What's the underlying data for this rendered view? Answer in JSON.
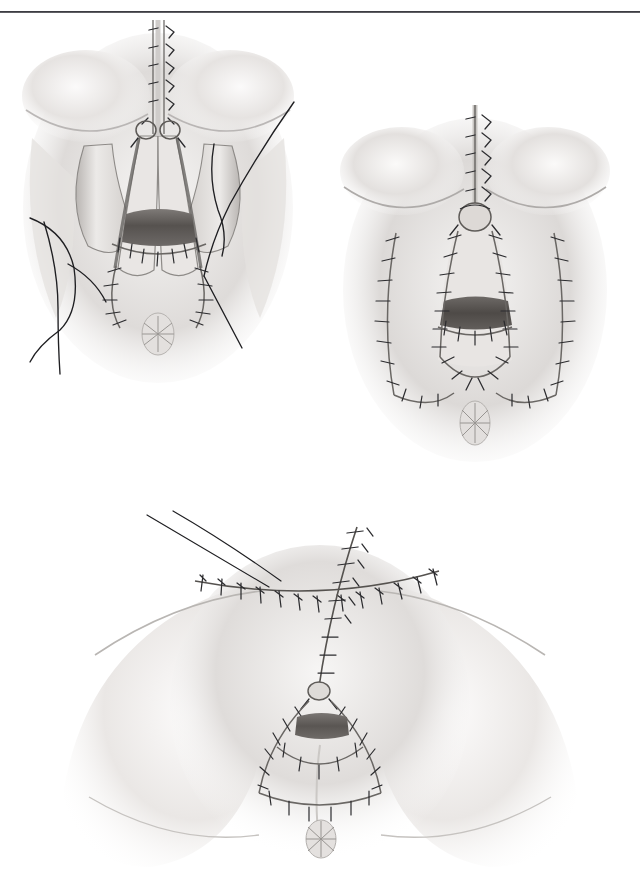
{
  "document": {
    "type": "surgical atlas page",
    "subject": "perineal wound closure and flap reconstruction",
    "background_color": "#ffffff",
    "rendering_style": "graphite pencil medical illustration"
  },
  "header": {
    "rule_color": "#2e2e33",
    "clipped_text": ".."
  },
  "figures": [
    {
      "id": "figure-1",
      "data_name": "figure-upper-left",
      "caption": "",
      "description": "Perineum with midline vertical suture line, everted flap edges held by long free suture strands on both sides, dark central opening, anus below",
      "elements": {
        "midline_suture_label": "midline vertical closure",
        "flap_label": "mobilized skin flap",
        "free_suture_label": "untied traction suture",
        "opening_label": "introital opening",
        "anus_label": "anus"
      },
      "colors": {
        "skin_light": "#f2f0ee",
        "skin_mid": "#c9c6c4",
        "skin_shadow": "#9a9795",
        "suture": "#2b2b2e",
        "opening_dark": "#56524f"
      }
    },
    {
      "id": "figure-2",
      "data_name": "figure-upper-right",
      "caption": "",
      "description": "Completed closure showing midline vertical suture line, central knot, paired V-shaped inner suture lines and two outer lateral donor-site suture lines",
      "elements": {
        "midline_suture_label": "midline vertical closure",
        "inner_v_label": "inner V-shaped suture line",
        "outer_lateral_label": "lateral donor-site closure",
        "opening_label": "introital opening",
        "anus_label": "anus"
      },
      "colors": {
        "skin_light": "#efedeb",
        "skin_mid": "#c4c1bf",
        "skin_shadow": "#94918f",
        "suture": "#2b2b2e",
        "opening_dark": "#4e4a47"
      }
    },
    {
      "id": "figure-3",
      "data_name": "figure-lower",
      "caption": "",
      "description": "Wider perineal view with thighs abducted showing T-shaped suture configuration: transverse suprapubic suture line crossed by a vertical midline suture line continuing to a V-shaped perineal closure, anus below",
      "elements": {
        "transverse_suture_label": "transverse suture line",
        "vertical_suture_label": "vertical midline suture line",
        "v_closure_label": "V-shaped perineal closure",
        "opening_label": "introital opening",
        "anus_label": "anus",
        "thigh_left_label": "left thigh",
        "thigh_right_label": "right thigh"
      },
      "colors": {
        "skin_light": "#f4f2f0",
        "skin_mid": "#cdcac8",
        "skin_shadow": "#a09d9b",
        "suture": "#2b2b2e",
        "opening_dark": "#5a5653"
      }
    }
  ]
}
